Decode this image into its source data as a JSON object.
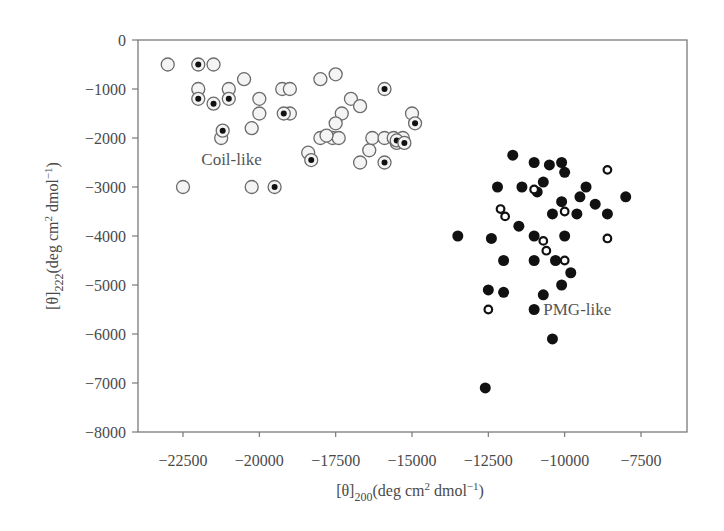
{
  "chart_data": {
    "type": "scatter",
    "title": "",
    "xlabel": "[θ]200(deg cm2 dmol−1)",
    "ylabel": "[θ]222(deg cm2 dmol−1)",
    "xlabel_parts": {
      "base": "[θ]",
      "sub": "200",
      "rest1": "(deg cm",
      "sup1": "2",
      "rest2": " dmol",
      "sup2": "−1",
      "rest3": ")"
    },
    "ylabel_parts": {
      "base": "[θ]",
      "sub": "222",
      "rest1": "(deg cm",
      "sup1": "2",
      "rest2": " dmol",
      "sup2": "−1",
      "rest3": ")"
    },
    "xlim": [
      -24000,
      -6300
    ],
    "ylim": [
      -8000,
      0
    ],
    "x_ticks": [
      -22500,
      -20000,
      -17500,
      -15000,
      -12500,
      -10000,
      -7500
    ],
    "x_tick_labels": [
      "−22500",
      "−20000",
      "−17500",
      "−15000",
      "−12500",
      "−10000",
      "−7500"
    ],
    "y_ticks": [
      0,
      -1000,
      -2000,
      -3000,
      -4000,
      -5000,
      -6000,
      -7000,
      -8000
    ],
    "y_tick_labels": [
      "0",
      "−1000",
      "−2000",
      "−3000",
      "−4000",
      "−5000",
      "−6000",
      "−7000",
      "−8000"
    ],
    "grid": false,
    "legend": null,
    "annotations": [
      {
        "text": "Coil-like",
        "x": -21900,
        "y": -2450
      },
      {
        "text": "PMG-like",
        "x": -10700,
        "y": -5500
      }
    ],
    "series": [
      {
        "name": "Coil-like (open circle)",
        "marker": "open-circle",
        "points": [
          [
            -23000,
            -500
          ],
          [
            -21500,
            -500
          ],
          [
            -22000,
            -1000
          ],
          [
            -21000,
            -1000
          ],
          [
            -20500,
            -800
          ],
          [
            -20000,
            -1200
          ],
          [
            -20000,
            -1500
          ],
          [
            -21250,
            -2000
          ],
          [
            -20250,
            -1800
          ],
          [
            -22500,
            -3000
          ],
          [
            -20250,
            -3000
          ],
          [
            -19250,
            -1000
          ],
          [
            -19000,
            -1000
          ],
          [
            -19000,
            -1500
          ],
          [
            -18000,
            -800
          ],
          [
            -17500,
            -700
          ],
          [
            -17000,
            -1200
          ],
          [
            -16700,
            -1350
          ],
          [
            -17300,
            -1500
          ],
          [
            -17500,
            -1700
          ],
          [
            -17600,
            -2000
          ],
          [
            -17400,
            -2000
          ],
          [
            -18000,
            -2000
          ],
          [
            -18400,
            -2300
          ],
          [
            -16700,
            -2500
          ],
          [
            -16400,
            -2250
          ],
          [
            -16300,
            -2000
          ],
          [
            -15900,
            -2000
          ],
          [
            -15600,
            -2000
          ],
          [
            -15500,
            -2100
          ],
          [
            -15300,
            -2000
          ],
          [
            -15000,
            -1500
          ],
          [
            -17800,
            -1950
          ]
        ]
      },
      {
        "name": "Coil-like (dotted circle)",
        "marker": "dot-in-circle",
        "points": [
          [
            -22000,
            -500
          ],
          [
            -22000,
            -1200
          ],
          [
            -21500,
            -1300
          ],
          [
            -21000,
            -1200
          ],
          [
            -21200,
            -1850
          ],
          [
            -19500,
            -3000
          ],
          [
            -19200,
            -1500
          ],
          [
            -18300,
            -2450
          ],
          [
            -15900,
            -1000
          ],
          [
            -15900,
            -2500
          ],
          [
            -15500,
            -2050
          ],
          [
            -15250,
            -2100
          ],
          [
            -14900,
            -1700
          ]
        ]
      },
      {
        "name": "PMG-like (filled circle)",
        "marker": "filled-circle",
        "points": [
          [
            -11700,
            -2350
          ],
          [
            -11000,
            -2500
          ],
          [
            -10500,
            -2550
          ],
          [
            -10100,
            -2500
          ],
          [
            -10000,
            -2700
          ],
          [
            -12200,
            -3000
          ],
          [
            -11400,
            -3000
          ],
          [
            -10700,
            -2900
          ],
          [
            -10900,
            -3100
          ],
          [
            -9500,
            -3200
          ],
          [
            -9300,
            -3000
          ],
          [
            -9000,
            -3350
          ],
          [
            -10100,
            -3300
          ],
          [
            -8000,
            -3200
          ],
          [
            -10400,
            -3550
          ],
          [
            -9600,
            -3550
          ],
          [
            -8600,
            -3550
          ],
          [
            -13500,
            -4000
          ],
          [
            -12400,
            -4050
          ],
          [
            -11500,
            -3800
          ],
          [
            -11000,
            -4000
          ],
          [
            -10000,
            -4000
          ],
          [
            -12000,
            -4500
          ],
          [
            -11000,
            -4500
          ],
          [
            -10300,
            -4500
          ],
          [
            -9800,
            -4750
          ],
          [
            -10100,
            -5000
          ],
          [
            -12500,
            -5100
          ],
          [
            -12000,
            -5150
          ],
          [
            -10700,
            -5200
          ],
          [
            -11000,
            -5500
          ],
          [
            -10400,
            -6100
          ],
          [
            -12600,
            -7100
          ]
        ]
      },
      {
        "name": "PMG-like (open circle)",
        "marker": "open-circle-bold",
        "points": [
          [
            -8600,
            -2650
          ],
          [
            -12100,
            -3450
          ],
          [
            -11950,
            -3600
          ],
          [
            -10000,
            -3500
          ],
          [
            -11000,
            -3050
          ],
          [
            -8600,
            -4050
          ],
          [
            -10700,
            -4100
          ],
          [
            -10600,
            -4300
          ],
          [
            -10000,
            -4500
          ],
          [
            -12500,
            -5500
          ]
        ]
      }
    ]
  },
  "layout": {
    "plot": {
      "left": 138,
      "top": 40,
      "right": 687,
      "bottom": 432
    },
    "x_px": {
      "v0": -22500,
      "p0": 183,
      "v1": -7500,
      "p1": 641
    },
    "y_px": {
      "v0": 0,
      "p0": 40,
      "v1": -8000,
      "p1": 432
    }
  },
  "colors": {
    "axis": "#7a7a7a",
    "marker_edge": "#6b6b6b",
    "marker_fill_open": "#f4f4f4",
    "marker_fill_solid": "#111111",
    "text": "#4a4a4a"
  }
}
